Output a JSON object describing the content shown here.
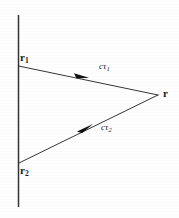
{
  "figure": {
    "background_color": "#fefefe",
    "ink_color": "#1a1a1a",
    "width": 179,
    "height": 218,
    "labels": {
      "source_point_1": {
        "symbol": "r",
        "subscript": "1"
      },
      "source_point_2": {
        "symbol": "r",
        "subscript": "2"
      },
      "field_point": {
        "symbol": "r",
        "subscript": ""
      },
      "upper_path": {
        "symbol": "cτ",
        "subscript": "1"
      },
      "lower_path": {
        "symbol": "cτ",
        "subscript": "2"
      }
    },
    "geometry": {
      "worldline": {
        "x": 18,
        "y_top": 15,
        "y_bottom": 207
      },
      "vertex_r1": {
        "x": 18,
        "y": 66
      },
      "vertex_r2": {
        "x": 19,
        "y": 163
      },
      "vertex_r": {
        "x": 158,
        "y": 95
      },
      "arrow_upper": {
        "x": 82,
        "y": 75
      },
      "arrow_lower": {
        "x": 85,
        "y": 128
      }
    }
  }
}
